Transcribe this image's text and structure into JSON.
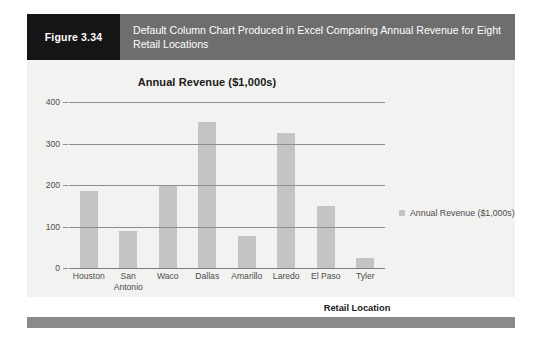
{
  "figure": {
    "number_label": "Figure 3.34",
    "caption": "Default Column Chart Produced in Excel Comparing Annual Revenue for Eight Retail Locations"
  },
  "colors": {
    "header_band": "#6e6e6e",
    "number_block": "#151515",
    "card_background": "#f2f2f0",
    "bar_fill": "#c4c4c4",
    "gridline": "#8e8e8e",
    "footer_bar": "#8a8a8a",
    "axis_text": "#4d4d4d"
  },
  "legend": {
    "position": "right",
    "entries": [
      {
        "label": "Annual Revenue ($1,000s)",
        "color": "#c4c4c4"
      }
    ]
  },
  "chart_data": {
    "type": "bar",
    "title": "Annual Revenue ($1,000s)",
    "xlabel": "Retail Location",
    "ylabel": "",
    "categories": [
      "Houston",
      "San Antonio",
      "Waco",
      "Dallas",
      "Amarillo",
      "Laredo",
      "El Paso",
      "Tyler"
    ],
    "category_lines": [
      [
        "Houston"
      ],
      [
        "San",
        "Antonio"
      ],
      [
        "Waco"
      ],
      [
        "Dallas"
      ],
      [
        "Amarillo"
      ],
      [
        "Laredo"
      ],
      [
        "El Paso"
      ],
      [
        "Tyler"
      ]
    ],
    "values": [
      185,
      88,
      197,
      352,
      78,
      325,
      150,
      25
    ],
    "series": [
      {
        "name": "Annual Revenue ($1,000s)",
        "values": [
          185,
          88,
          197,
          352,
          78,
          325,
          150,
          25
        ]
      }
    ],
    "ylim": [
      0,
      400
    ],
    "yticks": [
      0,
      100,
      200,
      300,
      400
    ],
    "ytick_labels": [
      "0",
      "100",
      "200",
      "300",
      "400"
    ],
    "grid": true,
    "grid_axis": "y",
    "legend_position": "right"
  }
}
